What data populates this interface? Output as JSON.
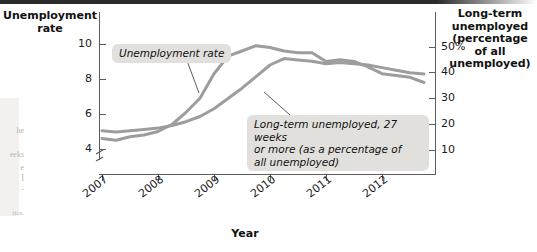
{
  "chart_data": {
    "type": "line",
    "title": "",
    "xlabel": "Year",
    "ylabel": "Unemployment rate",
    "y2label": "Long-term unemployed (percentage of all unemployed)",
    "grid": false,
    "legend_position": "inline-annotations",
    "x_tick_labels": [
      "2007",
      "2008",
      "2009",
      "2010",
      "2011",
      "2012"
    ],
    "y_left_ticks": [
      "4",
      "6",
      "8",
      "10"
    ],
    "y_left_lim": [
      3.2,
      11.2
    ],
    "y_left_axis_break": true,
    "y_right_ticks": [
      "10",
      "20",
      "30",
      "40",
      "50%"
    ],
    "y_right_lim": [
      0,
      56
    ],
    "series": [
      {
        "name": "Unemployment rate",
        "axis": "left",
        "units": "percent",
        "x": [
          2007.0,
          2007.25,
          2007.5,
          2007.75,
          2008.0,
          2008.25,
          2008.5,
          2008.75,
          2009.0,
          2009.25,
          2009.5,
          2009.75,
          2010.0,
          2010.25,
          2010.5,
          2010.75,
          2011.0,
          2011.25,
          2011.5,
          2011.75,
          2012.0,
          2012.25,
          2012.5,
          2012.75
        ],
        "values": [
          4.6,
          4.5,
          4.7,
          4.8,
          5.0,
          5.4,
          6.1,
          6.9,
          8.3,
          9.3,
          9.6,
          9.9,
          9.8,
          9.6,
          9.5,
          9.5,
          9.0,
          9.1,
          9.0,
          8.7,
          8.3,
          8.2,
          8.1,
          7.8
        ],
        "color": "#9d9d9d"
      },
      {
        "name": "Long-term unemployed, 27 weeks or more (as a percentage of all unemployed)",
        "axis": "right",
        "units": "percent of all unemployed",
        "x": [
          2007.0,
          2007.25,
          2007.5,
          2007.75,
          2008.0,
          2008.25,
          2008.5,
          2008.75,
          2009.0,
          2009.25,
          2009.5,
          2009.75,
          2010.0,
          2010.25,
          2010.5,
          2010.75,
          2011.0,
          2011.25,
          2011.5,
          2011.75,
          2012.0,
          2012.25,
          2012.5,
          2012.75
        ],
        "values": [
          17.5,
          17.0,
          17.5,
          18.0,
          18.5,
          19.5,
          21.0,
          23.0,
          26.0,
          30.0,
          34.0,
          38.5,
          43.0,
          45.5,
          45.0,
          44.5,
          43.5,
          44.0,
          43.5,
          43.0,
          42.0,
          41.0,
          40.0,
          39.5
        ],
        "color": "#9d9d9d"
      }
    ],
    "annotations": [
      {
        "text": "Unemployment rate",
        "target_series": "Unemployment rate"
      },
      {
        "text": "Long-term unemployed, 27 weeks or more (as a percentage of all unemployed)",
        "target_series": "Long-term unemployed"
      }
    ]
  },
  "axes": {
    "left_title": "Unemployment rate",
    "right_title_lines": [
      "Long-term",
      "unemployed",
      "(percentage",
      "of all",
      "unemployed)"
    ],
    "x_title": "Year"
  },
  "ticks": {
    "left": [
      {
        "label": "10",
        "top": 44
      },
      {
        "label": "8",
        "top": 79
      },
      {
        "label": "6",
        "top": 114
      },
      {
        "label": "4",
        "top": 149
      }
    ],
    "right": [
      {
        "label": "50%",
        "top": 47
      },
      {
        "label": "40",
        "top": 72
      },
      {
        "label": "30",
        "top": 98
      },
      {
        "label": "20",
        "top": 124
      },
      {
        "label": "10",
        "top": 150
      }
    ],
    "x": [
      {
        "label": "2007",
        "left": 102
      },
      {
        "label": "2008",
        "left": 158
      },
      {
        "label": "2009",
        "left": 214
      },
      {
        "label": "2010",
        "left": 270
      },
      {
        "label": "2011",
        "left": 326
      },
      {
        "label": "2012",
        "left": 382
      }
    ]
  },
  "callouts": {
    "unemployment": "Unemployment rate",
    "longterm_line1": "Long-term unemployed, 27 weeks",
    "longterm_line2": "or more (as a percentage of",
    "longterm_line3": "all unemployed)"
  },
  "page_bleed": {
    "l1": "he",
    "l2": "eeks",
    "l3": "e",
    "l4": "l",
    "l5": "-",
    "l6": "tics."
  },
  "colors": {
    "series": "#9d9d9d",
    "axis": "#5c5c5c",
    "callout_bg": "#e2e0dd",
    "text": "#111111"
  }
}
